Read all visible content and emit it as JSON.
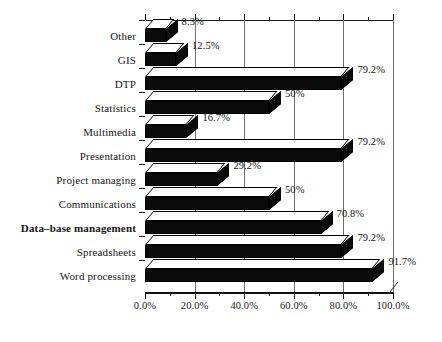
{
  "chart_data": {
    "type": "bar",
    "orientation": "horizontal",
    "title": "",
    "subtitle": "",
    "xlabel": "",
    "ylabel": "",
    "xlim": [
      0,
      100
    ],
    "grid": true,
    "legend": null,
    "style": "3d-scanned-bw",
    "categories": [
      "Other",
      "GIS",
      "DTP",
      "Statistics",
      "Multimedia",
      "Presentation",
      "Project managing",
      "Communications",
      "Data–base management",
      "Spreadsheets",
      "Word processing"
    ],
    "values": [
      8.3,
      12.5,
      79.2,
      50,
      16.7,
      79.2,
      29.2,
      50,
      70.8,
      79.2,
      91.7
    ],
    "data_labels": [
      "8.3%",
      "12.5%",
      "79.2%",
      "50%",
      "16.7%",
      "79.2%",
      "29.2%",
      "50%",
      "70.8%",
      "79.2%",
      "91.7%"
    ],
    "bold_categories": [
      "Data–base management"
    ],
    "xticks": [
      0,
      20,
      40,
      60,
      80,
      100
    ],
    "xtick_labels": [
      "0.0%",
      "20.0%",
      "40.0%",
      "60.0%",
      "80.0%",
      "100.0%"
    ],
    "xminor_ticks": [
      10,
      30,
      50,
      70,
      90
    ],
    "colors": {
      "bar_front": "#0b0b0b",
      "bar_top": "#fdfdfd",
      "bar_outline": "#000000",
      "gridline": "#6d6d6d",
      "axis": "#111111",
      "text": "#1a1a1a",
      "background": "#ffffff"
    }
  }
}
